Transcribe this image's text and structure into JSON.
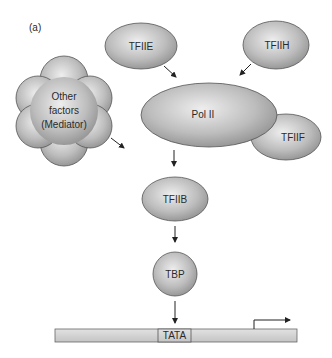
{
  "panel_label": "(a)",
  "components": {
    "tfiie": "TFIIE",
    "tfiih": "TFIIH",
    "pol2": "Pol II",
    "tfiif": "TFIIF",
    "mediator_line1": "Other",
    "mediator_line2": "factors",
    "mediator_line3": "(Mediator)",
    "tfiib": "TFIIB",
    "tbp": "TBP"
  },
  "dna": {
    "tata_label": "TATA"
  },
  "colors": {
    "shape_light": "#e6e6e6",
    "shape_dark": "#9a9a9a",
    "outline": "#555555",
    "dna_fill": "#d4d4d4"
  }
}
